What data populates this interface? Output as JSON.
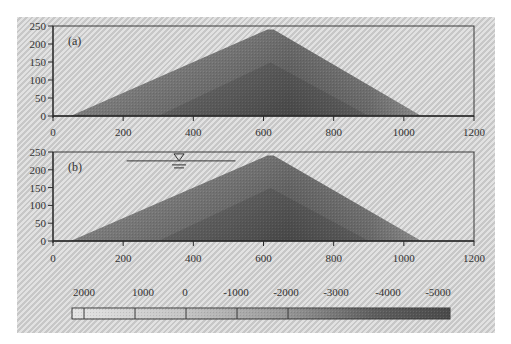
{
  "chart_data": [
    {
      "type": "heatmap",
      "panel_label": "(a)",
      "title": "",
      "xlabel": "",
      "ylabel": "",
      "xlim": [
        0,
        1200
      ],
      "ylim": [
        0,
        250
      ],
      "xticks": [
        0,
        200,
        400,
        600,
        800,
        1000,
        1200
      ],
      "yticks": [
        0,
        50,
        100,
        150,
        200,
        250
      ],
      "grid": false,
      "dam_profile": {
        "left_toe_x": 50,
        "crest_x": 620,
        "crest_y": 240,
        "right_toe_x": 1050
      },
      "water_level": null
    },
    {
      "type": "heatmap",
      "panel_label": "(b)",
      "title": "",
      "xlabel": "",
      "ylabel": "",
      "xlim": [
        0,
        1200
      ],
      "ylim": [
        0,
        250
      ],
      "xticks": [
        0,
        200,
        400,
        600,
        800,
        1000,
        1200
      ],
      "yticks": [
        0,
        50,
        100,
        150,
        200,
        250
      ],
      "grid": false,
      "dam_profile": {
        "left_toe_x": 50,
        "crest_x": 620,
        "crest_y": 240,
        "right_toe_x": 1050
      },
      "water_level": {
        "x_start": 210,
        "x_end": 520,
        "y": 225,
        "symbol": "▽"
      }
    }
  ],
  "colorbar": {
    "labels": [
      "2000",
      "1000",
      "0",
      "-1000",
      "-2000",
      "-3000",
      "-4000",
      "-5000"
    ],
    "colors": [
      "#e2e2e2",
      "#d6d6d6",
      "#bdbdbd",
      "#a3a3a3",
      "#8a8a8a",
      "#707070",
      "#5a5a5a",
      "#4a4a4a"
    ],
    "orientation": "horizontal",
    "position": "bottom"
  }
}
